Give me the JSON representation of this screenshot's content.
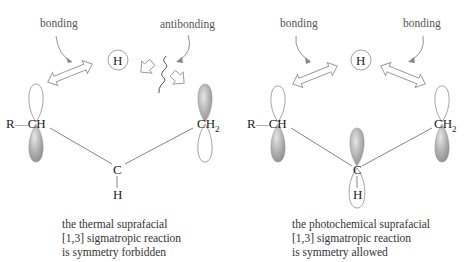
{
  "left_panel": {
    "labels": {
      "bonding": "bonding",
      "antibonding": "antibonding"
    },
    "hydrogen": "H",
    "atoms": {
      "left_group_r": "R",
      "left_group_dash": "—",
      "left_group_ch": "CH",
      "right_group_c": "CH",
      "right_group_sub": "2",
      "center_c": "C",
      "center_h": "H"
    },
    "caption": [
      "the thermal suprafacial",
      "[1,3] sigmatropic reaction",
      "is symmetry forbidden"
    ]
  },
  "right_panel": {
    "labels": {
      "bonding_left": "bonding",
      "bonding_right": "bonding"
    },
    "hydrogen": "H",
    "atoms": {
      "left_group_r": "R",
      "left_group_dash": "—",
      "left_group_ch": "CH",
      "right_group_c": "CH",
      "right_group_sub": "2",
      "center_c": "C",
      "center_h": "H"
    },
    "caption": [
      "the photochemical suprafacial",
      "[1,3] sigmatropic reaction",
      "is symmetry allowed"
    ]
  },
  "colors": {
    "lobe_fill": "#a9a9a9",
    "lobe_outline": "#9a9a9a",
    "line": "#777777",
    "text": "#333333"
  }
}
